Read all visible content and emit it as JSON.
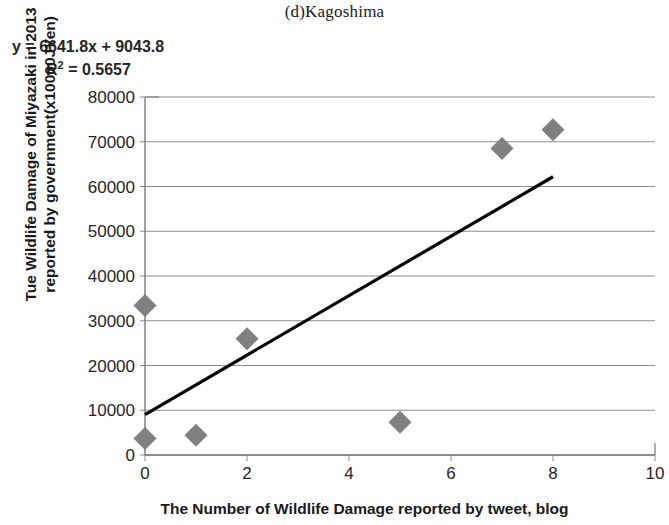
{
  "chart_data": {
    "type": "scatter",
    "title": "(d)Kagoshima",
    "xlabel": "The Number of Wildlife Damage reported by tweet, blog",
    "ylabel_line1": "Tue Wildlife Damage of Miyazaki in 2013",
    "ylabel_line2": "reported by government(x10000JYen)",
    "annotations": {
      "equation": "y = 6641.8x + 9043.8",
      "r_squared_label": "R",
      "r_squared_exponent": "2",
      "r_squared_value": " = 0.5657"
    },
    "regression": {
      "slope": 6641.8,
      "intercept": 9043.8,
      "r2": 0.5657,
      "x_start": 0,
      "x_end": 8,
      "y_start": 9043.8,
      "y_end": 62178.2
    },
    "xlim": [
      0,
      10
    ],
    "ylim": [
      0,
      80000
    ],
    "xticks": [
      0,
      2,
      4,
      6,
      8,
      10
    ],
    "xtick_labels": [
      "0",
      "2",
      "4",
      "6",
      "8",
      "10"
    ],
    "yticks": [
      0,
      10000,
      20000,
      30000,
      40000,
      50000,
      60000,
      70000,
      80000
    ],
    "ytick_labels": [
      "0",
      "10000",
      "20000",
      "30000",
      "40000",
      "50000",
      "60000",
      "70000",
      "80000"
    ],
    "grid": "horizontal",
    "legend": "none",
    "marker": "diamond",
    "marker_color": "#808080",
    "line_color": "#000000",
    "points": [
      {
        "x": 0,
        "y": 33400
      },
      {
        "x": 0,
        "y": 3700
      },
      {
        "x": 1,
        "y": 4400
      },
      {
        "x": 2,
        "y": 26000
      },
      {
        "x": 5,
        "y": 7300
      },
      {
        "x": 7,
        "y": 68500
      },
      {
        "x": 8,
        "y": 72700
      }
    ]
  }
}
